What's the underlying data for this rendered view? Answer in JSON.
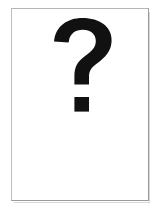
{
  "page": {
    "kind": "image-placeholder",
    "background_color": "#ffffff",
    "width": 160,
    "height": 216
  },
  "frame": {
    "name": "placeholder-frame",
    "border_color": "#9a9a9a",
    "fill_color": "#ffffff",
    "left": 11,
    "top": 8,
    "width": 138,
    "height": 193
  },
  "glyph": {
    "icon": "question-mark-icon",
    "character": "?",
    "color": "#111111",
    "alt_text": "?",
    "left": 50,
    "top": 42,
    "width": 68,
    "height": 102
  },
  "shadow": {
    "color": "#d8d8d8"
  }
}
